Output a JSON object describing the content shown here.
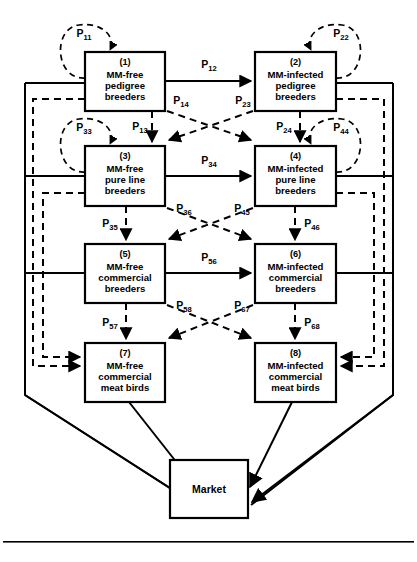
{
  "diagram": {
    "type": "flow-diagram",
    "colors": {
      "stroke": "#000000",
      "background": "#ffffff"
    },
    "nodes": [
      {
        "id": "1",
        "number": "(1)",
        "lines": [
          "MM-free",
          "pedigree",
          "breeders"
        ],
        "x": 85,
        "y": 52,
        "w": 80,
        "h": 59
      },
      {
        "id": "2",
        "number": "(2)",
        "lines": [
          "MM-infected",
          "pedigree",
          "breeders"
        ],
        "x": 255,
        "y": 52,
        "w": 81,
        "h": 59
      },
      {
        "id": "3",
        "number": "(3)",
        "lines": [
          "MM-free",
          "pure line",
          "breeders"
        ],
        "x": 85,
        "y": 146,
        "w": 80,
        "h": 60
      },
      {
        "id": "4",
        "number": "(4)",
        "lines": [
          "MM-infected",
          "pure line",
          "breeders"
        ],
        "x": 255,
        "y": 146,
        "w": 81,
        "h": 60
      },
      {
        "id": "5",
        "number": "(5)",
        "lines": [
          "MM-free",
          "commercial",
          "breeders"
        ],
        "x": 85,
        "y": 244,
        "w": 80,
        "h": 59
      },
      {
        "id": "6",
        "number": "(6)",
        "lines": [
          "MM-infected",
          "commercial",
          "breeders"
        ],
        "x": 255,
        "y": 244,
        "w": 81,
        "h": 59
      },
      {
        "id": "7",
        "number": "(7)",
        "lines": [
          "MM-free",
          "commercial",
          "meat birds"
        ],
        "x": 85,
        "y": 343,
        "w": 80,
        "h": 59
      },
      {
        "id": "8",
        "number": "(8)",
        "lines": [
          "MM-infected",
          "commercial",
          "meat birds"
        ],
        "x": 255,
        "y": 343,
        "w": 81,
        "h": 59
      },
      {
        "id": "market",
        "number": "",
        "lines": [
          "Market"
        ],
        "x": 170,
        "y": 460,
        "w": 78,
        "h": 58
      }
    ],
    "self_loops": [
      {
        "id": "P11",
        "base": "P",
        "sub": "11",
        "node": "1",
        "side": "left",
        "label_x": 84,
        "label_y": 37
      },
      {
        "id": "P22",
        "base": "P",
        "sub": "22",
        "node": "2",
        "side": "right",
        "label_x": 341,
        "label_y": 37
      },
      {
        "id": "P33",
        "base": "P",
        "sub": "33",
        "node": "3",
        "side": "left",
        "label_x": 84,
        "label_y": 131
      },
      {
        "id": "P44",
        "base": "P",
        "sub": "44",
        "node": "4",
        "side": "right",
        "label_x": 341,
        "label_y": 131
      }
    ],
    "links": [
      {
        "id": "P12",
        "base": "P",
        "sub": "12",
        "style": "solid",
        "from": "1",
        "to": "2",
        "label_x": 209,
        "label_y": 68
      },
      {
        "id": "P13",
        "base": "P",
        "sub": "13",
        "style": "dashed",
        "from": "1",
        "to": "3",
        "label_x": 140,
        "label_y": 130
      },
      {
        "id": "P14",
        "base": "P",
        "sub": "14",
        "style": "dashed",
        "from": "1",
        "to": "4",
        "label_x": 181,
        "label_y": 104
      },
      {
        "id": "P23",
        "base": "P",
        "sub": "23",
        "style": "dashed",
        "from": "2",
        "to": "3",
        "label_x": 243,
        "label_y": 104
      },
      {
        "id": "P24",
        "base": "P",
        "sub": "24",
        "style": "dashed",
        "from": "2",
        "to": "4",
        "label_x": 284,
        "label_y": 130
      },
      {
        "id": "P34",
        "base": "P",
        "sub": "34",
        "style": "solid",
        "from": "3",
        "to": "4",
        "label_x": 209,
        "label_y": 164
      },
      {
        "id": "P35",
        "base": "P",
        "sub": "35",
        "style": "dashed",
        "from": "3",
        "to": "5",
        "label_x": 110,
        "label_y": 227
      },
      {
        "id": "P36",
        "base": "P",
        "sub": "36",
        "style": "dashed",
        "from": "3",
        "to": "6",
        "label_x": 184,
        "label_y": 212
      },
      {
        "id": "P45",
        "base": "P",
        "sub": "45",
        "style": "dashed",
        "from": "4",
        "to": "5",
        "label_x": 242,
        "label_y": 212
      },
      {
        "id": "P46",
        "base": "P",
        "sub": "46",
        "style": "dashed",
        "from": "4",
        "to": "6",
        "label_x": 312,
        "label_y": 227
      },
      {
        "id": "P56",
        "base": "P",
        "sub": "56",
        "style": "solid",
        "from": "5",
        "to": "6",
        "label_x": 209,
        "label_y": 261
      },
      {
        "id": "P57",
        "base": "P",
        "sub": "57",
        "style": "dashed",
        "from": "5",
        "to": "7",
        "label_x": 110,
        "label_y": 326
      },
      {
        "id": "P58",
        "base": "P",
        "sub": "58",
        "style": "dashed",
        "from": "5",
        "to": "8",
        "label_x": 184,
        "label_y": 309
      },
      {
        "id": "P67",
        "base": "P",
        "sub": "67",
        "style": "dashed",
        "from": "6",
        "to": "7",
        "label_x": 242,
        "label_y": 309
      },
      {
        "id": "P68",
        "base": "P",
        "sub": "68",
        "style": "dashed",
        "from": "6",
        "to": "8",
        "label_x": 312,
        "label_y": 326
      }
    ],
    "market_inflows": [
      "7",
      "8",
      "frame-left",
      "frame-right"
    ],
    "feedback_arrows_into_7": 2,
    "feedback_arrows_into_8": 2
  }
}
